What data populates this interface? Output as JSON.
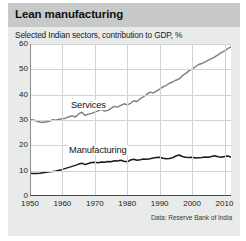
{
  "chart_title": "Lean manufacturing",
  "chart_subtitle": "Selected Indian sectors, contribution to GDP, %",
  "source_note": "Data: Reserve Bank of India",
  "colors": {
    "title_band": "#c8c9c9",
    "card_background": "#e9eaea",
    "plot_background": "#ffffff",
    "gridline": "#d2d3d3",
    "axis": "#4a4a4a",
    "services_line": "#7d7e7e",
    "manufacturing_line": "#1c1c1c"
  },
  "chart_data": {
    "type": "line",
    "title": "Lean manufacturing",
    "subtitle": "Selected Indian sectors, contribution to GDP, %",
    "xlabel": "",
    "ylabel": "",
    "xlim": [
      1950,
      2012
    ],
    "ylim": [
      0,
      60
    ],
    "grid": true,
    "legend_position": "inline-labels",
    "y_ticks": [
      0,
      10,
      20,
      30,
      40,
      50,
      60
    ],
    "x_ticks": [
      1950,
      1960,
      1970,
      1980,
      1990,
      2000,
      2010
    ],
    "annotations": [
      "Services",
      "Manufacturing"
    ],
    "x": [
      1950,
      1951,
      1952,
      1953,
      1954,
      1955,
      1956,
      1957,
      1958,
      1959,
      1960,
      1961,
      1962,
      1963,
      1964,
      1965,
      1966,
      1967,
      1968,
      1969,
      1970,
      1971,
      1972,
      1973,
      1974,
      1975,
      1976,
      1977,
      1978,
      1979,
      1980,
      1981,
      1982,
      1983,
      1984,
      1985,
      1986,
      1987,
      1988,
      1989,
      1990,
      1991,
      1992,
      1993,
      1994,
      1995,
      1996,
      1997,
      1998,
      1999,
      2000,
      2001,
      2002,
      2003,
      2004,
      2005,
      2006,
      2007,
      2008,
      2009,
      2010,
      2011,
      2012
    ],
    "series": [
      {
        "name": "Services",
        "color": "#7d7e7e",
        "values": [
          30.1,
          30.0,
          29.6,
          29.2,
          29.0,
          29.3,
          29.5,
          30.1,
          29.9,
          30.3,
          30.5,
          30.7,
          31.3,
          31.6,
          31.2,
          32.4,
          33.1,
          31.8,
          32.3,
          32.6,
          33.1,
          33.6,
          34.2,
          33.5,
          33.8,
          34.6,
          35.4,
          35.1,
          35.8,
          36.4,
          36.0,
          36.6,
          37.6,
          37.3,
          38.4,
          39.2,
          40.1,
          41.0,
          40.6,
          41.4,
          42.2,
          43.1,
          43.6,
          44.5,
          45.0,
          45.7,
          46.2,
          47.5,
          48.3,
          49.4,
          50.1,
          51.0,
          51.9,
          52.3,
          52.9,
          53.6,
          54.2,
          54.9,
          55.7,
          56.6,
          57.3,
          58.2,
          58.9
        ]
      },
      {
        "name": "Manufacturing",
        "color": "#1c1c1c",
        "values": [
          9.0,
          8.9,
          8.9,
          9.0,
          9.2,
          9.4,
          9.6,
          9.7,
          9.9,
          10.2,
          10.5,
          10.9,
          11.3,
          11.7,
          12.1,
          12.6,
          12.9,
          12.4,
          12.8,
          13.2,
          13.3,
          13.1,
          13.4,
          13.3,
          13.6,
          13.5,
          13.9,
          13.8,
          14.1,
          13.7,
          13.5,
          14.2,
          14.5,
          14.1,
          14.3,
          14.6,
          14.5,
          14.7,
          15.0,
          15.2,
          15.3,
          14.9,
          14.7,
          14.8,
          15.1,
          15.8,
          16.2,
          15.6,
          15.3,
          15.2,
          15.3,
          15.0,
          15.1,
          15.2,
          15.4,
          15.3,
          15.6,
          15.9,
          15.5,
          15.3,
          15.6,
          15.8,
          15.4
        ]
      }
    ]
  },
  "axis": {
    "y_tick_labels": [
      "60",
      "50",
      "40",
      "30",
      "20",
      "10",
      "0"
    ],
    "x_tick_labels": [
      "1950",
      "1960",
      "1970",
      "1980",
      "1990",
      "2000",
      "2010"
    ]
  }
}
